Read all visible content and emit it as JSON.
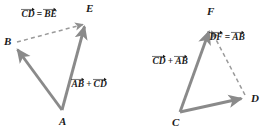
{
  "figure": {
    "stroke_color": "#8a8a8a",
    "dash_color": "#9a9a9a",
    "text_color": "#1a1a1a",
    "background": "#ffffff",
    "width": 267,
    "height": 130
  },
  "diagram_left": {
    "name": "left-vector-triangle",
    "vertices": [
      {
        "id": "A",
        "label": "A",
        "x": 62,
        "y": 110,
        "label_x": 59,
        "label_y": 116
      },
      {
        "id": "B",
        "label": "B",
        "x": 14,
        "y": 45,
        "label_x": 4,
        "label_y": 36
      },
      {
        "id": "E",
        "label": "E",
        "x": 86,
        "y": 22,
        "label_x": 86,
        "label_y": 3
      }
    ],
    "arrows": [
      {
        "id": "A-to-B",
        "from": "A",
        "to": "B",
        "style": "solid",
        "head": "to"
      },
      {
        "id": "A-to-E",
        "from": "A",
        "to": "E",
        "style": "solid",
        "head": "to"
      },
      {
        "id": "B-to-E",
        "from": "B",
        "to": "E",
        "style": "dashed",
        "head": "to"
      }
    ],
    "labels": [
      {
        "id": "cd-equals-be",
        "x": 21,
        "y": 10,
        "terms": [
          {
            "kind": "vector",
            "text": "CD"
          },
          {
            "kind": "operator",
            "text": "="
          },
          {
            "kind": "vector",
            "text": "BE"
          }
        ]
      },
      {
        "id": "ab-plus-cd",
        "x": 71,
        "y": 80,
        "terms": [
          {
            "kind": "vector",
            "text": "AB"
          },
          {
            "kind": "operator",
            "text": "+"
          },
          {
            "kind": "vector",
            "text": "CD"
          }
        ]
      }
    ]
  },
  "diagram_right": {
    "name": "right-vector-triangle",
    "vertices": [
      {
        "id": "C",
        "label": "C",
        "x": 180,
        "y": 112,
        "label_x": 172,
        "label_y": 117
      },
      {
        "id": "F",
        "label": "F",
        "x": 210,
        "y": 27,
        "label_x": 207,
        "label_y": 6
      },
      {
        "id": "D",
        "label": "D",
        "x": 245,
        "y": 98,
        "label_x": 251,
        "label_y": 93
      }
    ],
    "arrows": [
      {
        "id": "C-to-F",
        "from": "C",
        "to": "F",
        "style": "solid",
        "head": "to"
      },
      {
        "id": "C-to-D",
        "from": "C",
        "to": "D",
        "style": "solid",
        "head": "to"
      },
      {
        "id": "D-to-F",
        "from": "D",
        "to": "F",
        "style": "dashed",
        "head": "to"
      }
    ],
    "labels": [
      {
        "id": "df-equals-ab",
        "x": 209,
        "y": 33,
        "terms": [
          {
            "kind": "vector",
            "text": "DF"
          },
          {
            "kind": "operator",
            "text": "="
          },
          {
            "kind": "vector",
            "text": "AB"
          }
        ]
      },
      {
        "id": "cd-plus-ab",
        "x": 152,
        "y": 57,
        "terms": [
          {
            "kind": "vector",
            "text": "CD"
          },
          {
            "kind": "operator",
            "text": "+"
          },
          {
            "kind": "vector",
            "text": "AB"
          }
        ]
      }
    ]
  }
}
